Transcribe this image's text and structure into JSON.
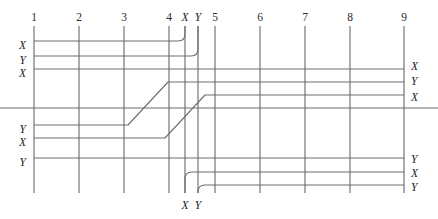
{
  "diagram": {
    "type": "wire-crossing-schematic",
    "canvas": {
      "width": 438,
      "height": 219
    },
    "stroke_color": "#6f6f6f",
    "text_color": "#1a1a1a",
    "columns": [
      {
        "label": "1",
        "x": 34
      },
      {
        "label": "2",
        "x": 79
      },
      {
        "label": "3",
        "x": 124
      },
      {
        "label": "4",
        "x": 169
      },
      {
        "label": "5",
        "x": 215
      },
      {
        "label": "6",
        "x": 260
      },
      {
        "label": "7",
        "x": 305
      },
      {
        "label": "8",
        "x": 350
      },
      {
        "label": "9",
        "x": 404
      }
    ],
    "column_label_y": 21,
    "column_top_y": 26,
    "column_bottom_y": 193,
    "top_taps": [
      {
        "label": "X",
        "x": 185,
        "label_y": 21
      },
      {
        "label": "Y",
        "x": 198,
        "label_y": 21
      }
    ],
    "bottom_taps": [
      {
        "label": "X",
        "x": 185,
        "label_y": 209
      },
      {
        "label": "Y",
        "x": 198,
        "label_y": 209
      }
    ],
    "left_labels": [
      {
        "label": "X",
        "y": 45
      },
      {
        "label": "Y",
        "y": 60
      },
      {
        "label": "X",
        "y": 73
      },
      {
        "label": "Y",
        "y": 129
      },
      {
        "label": "X",
        "y": 142
      },
      {
        "label": "Y",
        "y": 162
      }
    ],
    "right_labels": [
      {
        "label": "X",
        "y": 66
      },
      {
        "label": "Y",
        "y": 81
      },
      {
        "label": "X",
        "y": 97
      },
      {
        "label": "Y",
        "y": 159
      },
      {
        "label": "X",
        "y": 173
      },
      {
        "label": "Y",
        "y": 187
      }
    ],
    "wires": [
      {
        "name": "wire-top-x-tap",
        "path": "M 34 41 L 178 41 Q 185 41 185 34 L 185 26",
        "from": "left-X",
        "to": "top-tap-X"
      },
      {
        "name": "wire-top-y-tap",
        "path": "M 34 56 L 191 56 Q 198 56 198 49 L 198 26",
        "from": "left-Y",
        "to": "top-tap-Y"
      },
      {
        "name": "wire-straight-upper",
        "path": "M 34 69 L 404 69",
        "from": "left-X",
        "to": "right-X"
      },
      {
        "name": "wire-diagonal-lower-to-upper-a",
        "path": "M 34 125 L 128 125 L 168 82 L 404 82",
        "from": "left-Y",
        "to": "right-Y"
      },
      {
        "name": "wire-diagonal-lower-to-upper-b",
        "path": "M 34 138 L 165 138 L 205 95 L 404 95",
        "from": "left-X",
        "to": "right-X"
      },
      {
        "name": "wire-center-full-width",
        "path": "M 0 108 L 438 108",
        "from": "edge-left",
        "to": "edge-right"
      },
      {
        "name": "wire-straight-lower",
        "path": "M 34 158 L 404 158",
        "from": "left-Y",
        "to": "right-Y"
      },
      {
        "name": "wire-bottom-x-tap",
        "path": "M 185 193 L 185 179 Q 185 172 192 172 L 404 172",
        "from": "bottom-tap-X",
        "to": "right-X"
      },
      {
        "name": "wire-bottom-y-tap",
        "path": "M 198 193 L 198 192 Q 198 185 205 185 L 404 185",
        "from": "bottom-tap-Y",
        "to": "right-Y"
      }
    ]
  }
}
